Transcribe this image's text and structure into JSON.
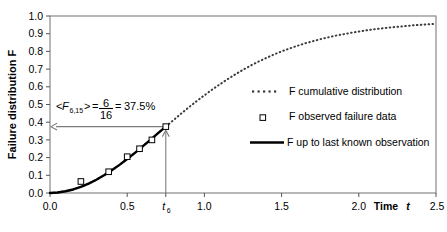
{
  "chart_data": {
    "type": "line",
    "title": "",
    "xlabel": "Time t",
    "ylabel": "Failure distribution F",
    "xlim": [
      0.0,
      2.5
    ],
    "ylim": [
      0.0,
      1.0
    ],
    "grid": false,
    "frame": true,
    "legend_position": "center-right",
    "xticks": [
      0.0,
      0.5,
      1.0,
      1.5,
      2.0,
      2.5
    ],
    "xticklabels": [
      "0.0",
      "0.5",
      "1.0",
      "1.5",
      "2.0",
      "2.5"
    ],
    "yticks": [
      0.0,
      0.1,
      0.2,
      0.3,
      0.4,
      0.5,
      0.6,
      0.7,
      0.8,
      0.9,
      1.0
    ],
    "yticklabels": [
      "0.0",
      "0.1",
      "0.2",
      "0.3",
      "0.4",
      "0.5",
      "0.6",
      "0.7",
      "0.8",
      "0.9",
      "1.0"
    ],
    "special_xtick": {
      "value": 0.75,
      "label": "t",
      "sublabel": "6"
    },
    "series": [
      {
        "name": "F cumulative distribution",
        "style": "dotted",
        "color": "#3a3a3a",
        "x": [
          0.0,
          0.05,
          0.1,
          0.15,
          0.2,
          0.25,
          0.3,
          0.35,
          0.4,
          0.45,
          0.5,
          0.55,
          0.6,
          0.65,
          0.7,
          0.75,
          0.8,
          0.85,
          0.9,
          0.95,
          1.0,
          1.05,
          1.1,
          1.15,
          1.2,
          1.25,
          1.3,
          1.35,
          1.4,
          1.45,
          1.5,
          1.55,
          1.6,
          1.65,
          1.7,
          1.75,
          1.8,
          1.85,
          1.9,
          1.95,
          2.0,
          2.05,
          2.1,
          2.15,
          2.2,
          2.25,
          2.3,
          2.35,
          2.4,
          2.45,
          2.5
        ],
        "y": [
          0.0,
          0.003,
          0.01,
          0.02,
          0.035,
          0.053,
          0.075,
          0.1,
          0.128,
          0.159,
          0.192,
          0.227,
          0.263,
          0.3,
          0.338,
          0.375,
          0.412,
          0.449,
          0.485,
          0.519,
          0.552,
          0.584,
          0.614,
          0.643,
          0.67,
          0.696,
          0.72,
          0.742,
          0.763,
          0.782,
          0.8,
          0.816,
          0.831,
          0.845,
          0.857,
          0.869,
          0.879,
          0.889,
          0.897,
          0.905,
          0.912,
          0.919,
          0.925,
          0.93,
          0.935,
          0.939,
          0.943,
          0.947,
          0.95,
          0.953,
          0.956
        ]
      },
      {
        "name": "F up to last known observation",
        "style": "solid-thick",
        "color": "#000000",
        "x": [
          0.0,
          0.05,
          0.1,
          0.15,
          0.2,
          0.25,
          0.3,
          0.35,
          0.4,
          0.45,
          0.5,
          0.55,
          0.6,
          0.65,
          0.7,
          0.75
        ],
        "y": [
          0.0,
          0.003,
          0.01,
          0.02,
          0.035,
          0.053,
          0.075,
          0.1,
          0.128,
          0.159,
          0.192,
          0.227,
          0.263,
          0.3,
          0.338,
          0.375
        ]
      },
      {
        "name": "F observed failure data",
        "style": "open-square-markers",
        "color": "#000000",
        "x": [
          0.2,
          0.38,
          0.5,
          0.58,
          0.66,
          0.75
        ],
        "y": [
          0.065,
          0.12,
          0.205,
          0.25,
          0.3,
          0.375
        ]
      }
    ],
    "annotations": [
      {
        "name": "mean-rank-annotation",
        "text_parts": {
          "open": "<",
          "symbol": "F",
          "subscript": "6,15",
          "close": ">",
          "equals1": "=",
          "numerator": "6",
          "denominator": "16",
          "equals2": "=",
          "result": "37.5%"
        },
        "full_text": "<F6,15> = 6/16 = 37.5%",
        "value": 0.375
      },
      {
        "name": "horizontal-arrow-to-axis",
        "from_x": 0.75,
        "to_x": 0.0,
        "y": 0.375
      },
      {
        "name": "vertical-arrow-to-point",
        "x": 0.75,
        "from_y": 0.0,
        "to_y": 0.375
      }
    ],
    "legend_entries": [
      {
        "label": "F cumulative distribution",
        "marker": "dotted-line"
      },
      {
        "label": "F observed failure data",
        "marker": "open-square"
      },
      {
        "label": "F up to last known observation",
        "marker": "thick-solid-line"
      }
    ]
  }
}
